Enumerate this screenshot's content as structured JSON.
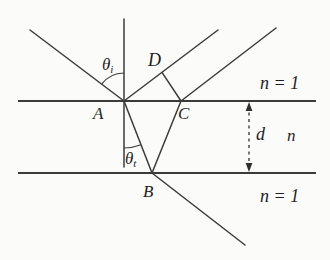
{
  "figure": {
    "colors": {
      "background": "#fbfbf9",
      "line": "#3b3b3b",
      "text": "#1f1f1f"
    },
    "labels": {
      "theta_i": {
        "base": "θ",
        "sub": "i"
      },
      "theta_t": {
        "base": "θ",
        "sub": "t"
      },
      "point_a": "A",
      "point_b": "B",
      "point_c": "C",
      "point_d": "D",
      "index_top": "n = 1",
      "index_slab": "n",
      "index_bottom": "n = 1",
      "thickness": "d"
    }
  }
}
